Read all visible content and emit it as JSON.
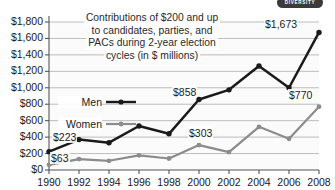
{
  "badge": {
    "label": "DIVERSITY"
  },
  "caption": {
    "lines": [
      "Contributions of $200 and up",
      "to candidates, parties, and",
      "PACs during 2-year election",
      "cycles (in $ millions)"
    ]
  },
  "legend": {
    "men": "Men",
    "women": "Women"
  },
  "colors": {
    "men": "#1a1a1a",
    "women": "#8c8c8c",
    "grid": "#b5b5b5",
    "axis": "#555555",
    "plot_background": "#fbfbfb",
    "badge_background": "#3b3b3b",
    "text": "#1a1a1a"
  },
  "annotations": [
    {
      "text": "$223",
      "series": "men",
      "year": 1990,
      "x": 52,
      "y": 131
    },
    {
      "text": "$63",
      "series": "women",
      "year": 1990,
      "x": 50,
      "y": 152
    },
    {
      "text": "$858",
      "series": "men",
      "year": 2000,
      "x": 172,
      "y": 86
    },
    {
      "text": "$303",
      "series": "women",
      "year": 2000,
      "x": 188,
      "y": 127
    },
    {
      "text": "$1,673",
      "series": "men",
      "year": 2008,
      "x": 264,
      "y": 18
    },
    {
      "text": "$770",
      "series": "women",
      "year": 2008,
      "x": 288,
      "y": 89
    }
  ],
  "chart_data": {
    "type": "line",
    "title": "Contributions of $200 and up to candidates, parties, and PACs during 2-year election cycles (in $ millions)",
    "xlabel": "",
    "ylabel": "",
    "x": [
      1990,
      1992,
      1994,
      1996,
      1998,
      2000,
      2002,
      2004,
      2006,
      2008
    ],
    "categories": [
      "1990",
      "1992",
      "1994",
      "1996",
      "1998",
      "2000",
      "2002",
      "2004",
      "2006",
      "2008"
    ],
    "series": [
      {
        "name": "Men",
        "values": [
          223,
          370,
          332,
          535,
          440,
          858,
          975,
          1265,
          1000,
          1673
        ]
      },
      {
        "name": "Women",
        "values": [
          63,
          133,
          112,
          178,
          140,
          303,
          218,
          525,
          380,
          770
        ]
      }
    ],
    "ylim": [
      0,
      1800
    ],
    "yticks": [
      0,
      200,
      400,
      600,
      800,
      1000,
      1200,
      1400,
      1600,
      1800
    ],
    "ytick_labels": [
      "$0",
      "$200",
      "$400",
      "$600",
      "$800",
      "$1,000",
      "$1,200",
      "$1,400",
      "$1,600",
      "$1,800"
    ],
    "xtick_labels": [
      "1990",
      "1992",
      "1994",
      "1996",
      "1998",
      "2000",
      "2002",
      "2004",
      "2006",
      "2008"
    ],
    "grid": true,
    "grid_axis": "y",
    "legend_position": "inside-left"
  }
}
